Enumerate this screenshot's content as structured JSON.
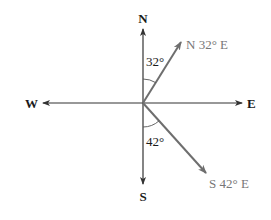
{
  "diagram": {
    "type": "compass-bearings",
    "center": [
      143,
      103
    ],
    "cardinal_labels": {
      "north": "N",
      "south": "S",
      "east": "E",
      "west": "W"
    },
    "bearings": [
      {
        "label": "N 32° E",
        "angle_label": "32°",
        "reference": "N",
        "degrees": 32,
        "toward": "E"
      },
      {
        "label": "S 42° E",
        "angle_label": "42°",
        "reference": "S",
        "degrees": 42,
        "toward": "E"
      }
    ],
    "colors": {
      "axes": "#333333",
      "vectors": "#6e6e6e",
      "vector_labels": "#777777"
    }
  }
}
